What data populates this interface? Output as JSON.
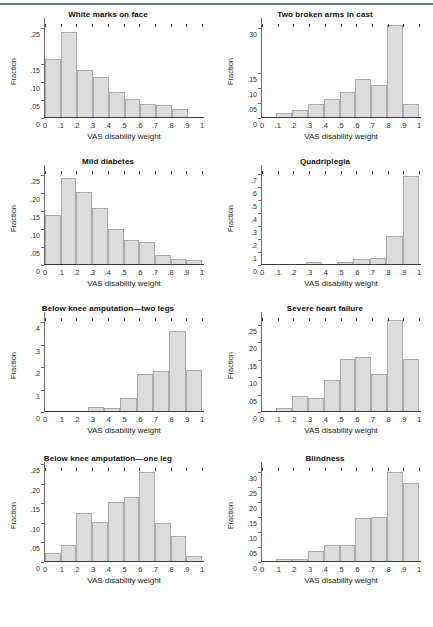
{
  "figure": {
    "caption": "",
    "xlabel": "VAS disability weight",
    "ylabel": "Fraction",
    "bar_fill": "#dcdcdc",
    "bar_stroke": "#a9a9a9"
  },
  "chart_data": [
    {
      "type": "bar",
      "title": "White marks on face",
      "xlabel": "VAS disability weight",
      "ylabel": "Fraction",
      "categories": [
        "0-.1",
        ".1-.2",
        ".2-.3",
        ".3-.4",
        ".4-.5",
        ".5-.6",
        ".6-.7",
        ".7-.8",
        ".8-.9",
        ".9-1"
      ],
      "values": [
        0.16,
        0.235,
        0.13,
        0.11,
        0.07,
        0.05,
        0.037,
        0.034,
        0.022,
        0.0
      ],
      "xticks": [
        "0",
        ".1",
        ".2",
        ".3",
        ".4",
        ".5",
        ".6",
        ".7",
        ".8",
        ".9",
        "1"
      ],
      "yticks": [
        "0",
        ".05",
        ".10",
        ".15",
        ".25"
      ],
      "ytick_values": [
        0,
        0.05,
        0.1,
        0.15,
        0.25
      ],
      "ylim": [
        0,
        0.26
      ],
      "xlim": [
        0,
        1
      ],
      "grid": false,
      "legend": "none"
    },
    {
      "type": "bar",
      "title": "Two broken arms in cast",
      "xlabel": "VAS disability weight",
      "ylabel": "Fraction",
      "categories": [
        "0-.1",
        ".1-.2",
        ".2-.3",
        ".3-.4",
        ".4-.5",
        ".5-.6",
        ".6-.7",
        ".7-.8",
        ".8-.9",
        ".9-1"
      ],
      "values": [
        0.0,
        0.015,
        0.022,
        0.045,
        0.06,
        0.084,
        0.128,
        0.106,
        0.307,
        0.045
      ],
      "xticks": [
        "0",
        ".1",
        ".2",
        ".3",
        ".4",
        ".5",
        ".6",
        ".7",
        ".8",
        ".9",
        "1"
      ],
      "yticks": [
        "0",
        ".05",
        ".10",
        ".15",
        "30"
      ],
      "ytick_values": [
        0,
        0.05,
        0.1,
        0.15,
        0.3
      ],
      "ylim": [
        0,
        0.315
      ],
      "xlim": [
        0,
        1
      ],
      "grid": false,
      "legend": "none"
    },
    {
      "type": "bar",
      "title": "Mild diabetes",
      "xlabel": "VAS disability weight",
      "ylabel": "Fraction",
      "categories": [
        "0-.1",
        ".1-.2",
        ".2-.3",
        ".3-.4",
        ".4-.5",
        ".5-.6",
        ".6-.7",
        ".7-.8",
        ".8-.9",
        ".9-1"
      ],
      "values": [
        0.135,
        0.238,
        0.2,
        0.155,
        0.098,
        0.067,
        0.06,
        0.026,
        0.015,
        0.01
      ],
      "xticks": [
        "0",
        ".1",
        ".2",
        ".3",
        ".4",
        ".5",
        ".6",
        ".7",
        ".8",
        ".9",
        "1"
      ],
      "yticks": [
        "0",
        ".05",
        ".10",
        ".15",
        ".20",
        ".25"
      ],
      "ytick_values": [
        0,
        0.05,
        0.1,
        0.15,
        0.2,
        0.25
      ],
      "ylim": [
        0,
        0.26
      ],
      "xlim": [
        0,
        1
      ],
      "grid": false,
      "legend": "none"
    },
    {
      "type": "bar",
      "title": "Quadriplegia",
      "xlabel": "VAS disability weight",
      "ylabel": "Fraction",
      "categories": [
        "0-.1",
        ".1-.2",
        ".2-.3",
        ".3-.4",
        ".4-.5",
        ".5-.6",
        ".6-.7",
        ".7-.8",
        ".8-.9",
        ".9-1"
      ],
      "values": [
        0.0,
        0.0,
        0.0,
        0.012,
        0.0,
        0.018,
        0.04,
        0.048,
        0.215,
        0.675
      ],
      "xticks": [
        "0",
        ".1",
        ".2",
        ".3",
        ".4",
        ".5",
        ".6",
        ".7",
        ".8",
        ".9",
        "1"
      ],
      "yticks": [
        "0",
        ".1",
        ".2",
        ".3",
        ".4",
        ".5",
        ".6",
        ".7"
      ],
      "ytick_values": [
        0,
        0.1,
        0.2,
        0.3,
        0.4,
        0.5,
        0.6,
        0.7
      ],
      "ylim": [
        0,
        0.72
      ],
      "xlim": [
        0,
        1
      ],
      "grid": false,
      "legend": "none"
    },
    {
      "type": "bar",
      "title": "Below knee amputation—two legs",
      "xlabel": "VAS disability weight",
      "ylabel": "Fraction",
      "categories": [
        "0-.1",
        ".1-.2",
        ".2-.3",
        ".3-.4",
        ".4-.5",
        ".5-.6",
        ".6-.7",
        ".7-.8",
        ".8-.9",
        ".9-1"
      ],
      "values": [
        0.0,
        0.0,
        0.0,
        0.02,
        0.013,
        0.058,
        0.167,
        0.179,
        0.357,
        0.182
      ],
      "xticks": [
        "0",
        ".1",
        ".2",
        ".3",
        ".4",
        ".5",
        ".6",
        ".7",
        ".8",
        ".9",
        "1"
      ],
      "yticks": [
        "0",
        ".1",
        ".2",
        ".3",
        ".4"
      ],
      "ytick_values": [
        0,
        0.1,
        0.2,
        0.3,
        0.4
      ],
      "ylim": [
        0,
        0.42
      ],
      "xlim": [
        0,
        1
      ],
      "grid": false,
      "legend": "none"
    },
    {
      "type": "bar",
      "title": "Severe heart failure",
      "xlabel": "VAS disability weight",
      "ylabel": "Fraction",
      "categories": [
        "0-.1",
        ".1-.2",
        ".2-.3",
        ".3-.4",
        ".4-.5",
        ".5-.6",
        ".6-.7",
        ".7-.8",
        ".8-.9",
        ".9-1"
      ],
      "values": [
        0.0,
        0.01,
        0.043,
        0.036,
        0.088,
        0.15,
        0.155,
        0.105,
        0.262,
        0.15
      ],
      "xticks": [
        "0",
        ".1",
        ".2",
        ".3",
        ".4",
        ".5",
        ".6",
        ".7",
        ".8",
        ".9",
        "1"
      ],
      "yticks": [
        "0",
        ".05",
        ".10",
        ".15",
        ".20",
        ".25"
      ],
      "ytick_values": [
        0,
        0.05,
        0.1,
        0.15,
        0.2,
        0.25
      ],
      "ylim": [
        0,
        0.27
      ],
      "xlim": [
        0,
        1
      ],
      "grid": false,
      "legend": "none"
    },
    {
      "type": "bar",
      "title": "Below knee amputation—one leg",
      "xlabel": "VAS disability weight",
      "ylabel": "Fraction",
      "categories": [
        "0-.1",
        ".1-.2",
        ".2-.3",
        ".3-.4",
        ".4-.5",
        ".5-.6",
        ".6-.7",
        ".7-.8",
        ".8-.9",
        ".9-1"
      ],
      "values": [
        0.021,
        0.042,
        0.122,
        0.1,
        0.15,
        0.163,
        0.228,
        0.098,
        0.063,
        0.012
      ],
      "xticks": [
        "0",
        ".1",
        ".2",
        ".3",
        ".4",
        ".5",
        ".6",
        ".7",
        ".8",
        ".9",
        "1"
      ],
      "yticks": [
        "0",
        ".05",
        ".10",
        ".15",
        ".20",
        ".25"
      ],
      "ytick_values": [
        0,
        0.05,
        0.1,
        0.15,
        0.2,
        0.25
      ],
      "ylim": [
        0,
        0.24
      ],
      "xlim": [
        0,
        1
      ],
      "grid": false,
      "legend": "none"
    },
    {
      "type": "bar",
      "title": "Blindness",
      "xlabel": "VAS disability weight",
      "ylabel": "Fraction",
      "categories": [
        "0-.1",
        ".1-.2",
        ".2-.3",
        ".3-.4",
        ".4-.5",
        ".5-.6",
        ".6-.7",
        ".7-.8",
        ".8-.9",
        ".9-1"
      ],
      "values": [
        0.0,
        0.008,
        0.008,
        0.034,
        0.052,
        0.053,
        0.143,
        0.148,
        0.297,
        0.261
      ],
      "xticks": [
        "0",
        ".1",
        ".2",
        ".3",
        ".4",
        ".5",
        ".6",
        ".7",
        ".8",
        ".9",
        "1"
      ],
      "yticks": [
        "0",
        ".05",
        ".10",
        ".15",
        ".20",
        ".25",
        ".30"
      ],
      "ytick_values": [
        0,
        0.05,
        0.1,
        0.15,
        0.2,
        0.25,
        0.3
      ],
      "ylim": [
        0,
        0.315
      ],
      "xlim": [
        0,
        1
      ],
      "grid": false,
      "legend": "none"
    }
  ]
}
